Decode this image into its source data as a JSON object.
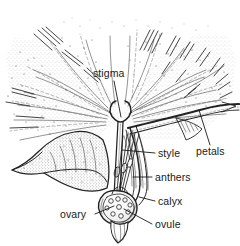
{
  "figure": {
    "kind": "botanical-line-drawing",
    "width": 240,
    "height": 246,
    "background_color": "#ffffff",
    "ink_color": "#232323",
    "label_color": "#1a1a1a"
  },
  "labels": [
    {
      "id": "stigma",
      "text": "stigma",
      "x": 93,
      "y": 77,
      "anchor": "start",
      "leader": {
        "x1": 114,
        "y1": 81,
        "x2": 121,
        "y2": 117
      }
    },
    {
      "id": "petals",
      "text": "petals",
      "x": 196,
      "y": 155,
      "anchor": "start",
      "leader": {
        "x1": 210,
        "y1": 145,
        "x2": 199,
        "y2": 110
      }
    },
    {
      "id": "style",
      "text": "style",
      "x": 158,
      "y": 157,
      "anchor": "start",
      "leader": {
        "x1": 155,
        "y1": 153,
        "x2": 122,
        "y2": 150
      }
    },
    {
      "id": "anthers",
      "text": "anthers",
      "x": 155,
      "y": 181,
      "anchor": "start",
      "leader": {
        "x1": 152,
        "y1": 177,
        "x2": 133,
        "y2": 177
      }
    },
    {
      "id": "calyx",
      "text": "calyx",
      "x": 158,
      "y": 205,
      "anchor": "start",
      "leader": {
        "x1": 155,
        "y1": 201,
        "x2": 139,
        "y2": 197
      }
    },
    {
      "id": "ovule",
      "text": "ovule",
      "x": 155,
      "y": 228,
      "anchor": "start",
      "leader": {
        "x1": 152,
        "y1": 224,
        "x2": 124,
        "y2": 209
      }
    },
    {
      "id": "ovary",
      "text": "ovary",
      "x": 60,
      "y": 218,
      "anchor": "start",
      "leader": {
        "x1": 95,
        "y1": 214,
        "x2": 114,
        "y2": 206
      }
    }
  ],
  "parts": [
    {
      "id": "stigma",
      "name": "stigma",
      "description": "forked cup at top of style"
    },
    {
      "id": "style",
      "name": "style",
      "description": "slender column from stigma to ovary"
    },
    {
      "id": "anthers",
      "name": "anthers",
      "description": "cluster of stamen tips beside style"
    },
    {
      "id": "ovary",
      "name": "ovary",
      "description": "rounded basal chamber"
    },
    {
      "id": "ovule",
      "name": "ovule",
      "description": "small round bodies within ovary"
    },
    {
      "id": "calyx",
      "name": "calyx",
      "description": "outer sepal sheath enclosing ovary"
    },
    {
      "id": "petals",
      "name": "petals",
      "description": "radiating rays spreading outward"
    }
  ]
}
